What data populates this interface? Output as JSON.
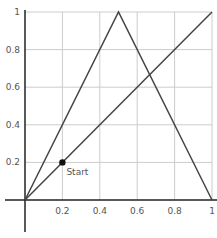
{
  "chart_data": {
    "type": "line",
    "title": "",
    "xlabel": "",
    "ylabel": "",
    "xlim": [
      0,
      1
    ],
    "ylim": [
      0,
      1
    ],
    "grid": true,
    "x_ticks": [
      {
        "value": 0.2,
        "label": "0.2"
      },
      {
        "value": 0.4,
        "label": "0.4"
      },
      {
        "value": 0.6,
        "label": "0.6"
      },
      {
        "value": 0.8,
        "label": "0.8"
      },
      {
        "value": 1,
        "label": "1"
      }
    ],
    "y_ticks": [
      {
        "value": 0.2,
        "label": "0.2"
      },
      {
        "value": 0.4,
        "label": "0.4"
      },
      {
        "value": 0.6,
        "label": "0.6"
      },
      {
        "value": 0.8,
        "label": "0.8"
      },
      {
        "value": 1,
        "label": "1"
      }
    ],
    "series": [
      {
        "name": "tent map",
        "x": [
          0,
          0.5,
          1
        ],
        "y": [
          0,
          1,
          0
        ]
      },
      {
        "name": "identity y=x",
        "x": [
          0,
          1
        ],
        "y": [
          0,
          1
        ]
      }
    ],
    "points": [
      {
        "x": 0.2,
        "y": 0.2,
        "label": "Start"
      }
    ],
    "colors": {
      "line": "#444444",
      "grid": "#cccccc",
      "axis": "#222222",
      "point": "#111111"
    }
  }
}
